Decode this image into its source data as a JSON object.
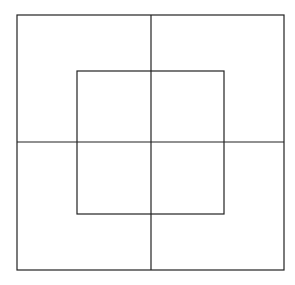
{
  "diagram": {
    "stroke_color": "#222222",
    "background": "#ffffff",
    "outer_square": {
      "x": 17,
      "y": 15,
      "width": 267,
      "height": 255
    },
    "inner_square": {
      "x": 77,
      "y": 71,
      "width": 147,
      "height": 143
    },
    "vertical_line": {
      "x": 151,
      "y1": 15,
      "y2": 270
    },
    "horizontal_line": {
      "y": 142,
      "x1": 17,
      "x2": 284
    }
  }
}
